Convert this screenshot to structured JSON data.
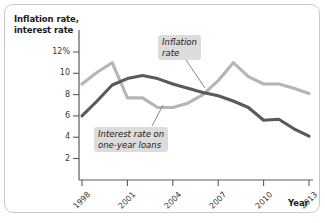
{
  "figure": {
    "background_color": "#ffffff",
    "border_color": "#c9c9c9"
  },
  "chart_data": {
    "type": "line",
    "title": "",
    "subtitle": "",
    "ylabel": "Inflation rate, interest rate",
    "xlabel": "Year",
    "x": [
      1998,
      1999,
      2000,
      2001,
      2002,
      2003,
      2004,
      2005,
      2006,
      2007,
      2008,
      2009,
      2010,
      2011,
      2012,
      2013
    ],
    "xlim": [
      1998,
      2013
    ],
    "ylim": [
      0,
      13
    ],
    "xtick_labels": [
      "1998",
      "2001",
      "2004",
      "2007",
      "2010",
      "2013"
    ],
    "xtick_values": [
      1998,
      2001,
      2004,
      2007,
      2010,
      2013
    ],
    "ytick_labels": [
      "12%",
      "10",
      "8",
      "6",
      "4",
      "2"
    ],
    "ytick_values": [
      12,
      10,
      8,
      6,
      4,
      2
    ],
    "grid": false,
    "legend_position": "inline-annotations",
    "series": [
      {
        "name": "Inflation rate",
        "color": "#b5b5b5",
        "values": [
          9.0,
          10.1,
          11.0,
          7.7,
          7.7,
          6.8,
          6.8,
          7.2,
          8.0,
          9.3,
          11.0,
          9.7,
          9.0,
          9.0,
          8.6,
          8.1
        ]
      },
      {
        "name": "Interest rate on one-year loans",
        "color": "#5a5a5a",
        "values": [
          6.0,
          7.4,
          8.9,
          9.5,
          9.8,
          9.5,
          9.0,
          8.6,
          8.2,
          7.9,
          7.4,
          6.8,
          5.6,
          5.7,
          4.8,
          4.1
        ]
      }
    ],
    "annotations": [
      {
        "id": "inflation",
        "text_line_1": "Inflation",
        "text_line_2": "rate",
        "style": "italic-gray-box"
      },
      {
        "id": "interest",
        "text_line_1": "Interest rate on",
        "text_line_2": "one-year loans",
        "style": "italic-gray-box"
      }
    ]
  }
}
